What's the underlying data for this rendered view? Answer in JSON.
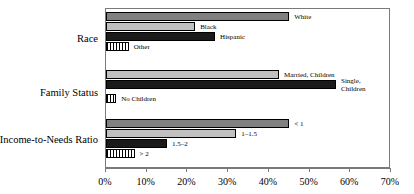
{
  "chart_data": {
    "type": "bar",
    "orientation": "horizontal",
    "title": "",
    "xlabel": "",
    "ylabel": "",
    "xlim": [
      0,
      70
    ],
    "xunit": "%",
    "xticks": [
      "0%",
      "10%",
      "20%",
      "30%",
      "40%",
      "50%",
      "60%",
      "70%"
    ],
    "xtick_values": [
      0,
      10,
      20,
      30,
      40,
      50,
      60,
      70
    ],
    "grid": false,
    "legend": "none",
    "groups": [
      {
        "label": "Race",
        "bars": [
          {
            "label": "White",
            "value": 45.0,
            "style": "dark-gray"
          },
          {
            "label": "Black",
            "value": 21.9,
            "style": "light-gray"
          },
          {
            "label": "Hispanic",
            "value": 26.8,
            "style": "black"
          },
          {
            "label": "Other",
            "value": 5.6,
            "style": "hatch"
          }
        ]
      },
      {
        "label": "Family Status",
        "bars": [
          {
            "label": "Married, Children",
            "value": 42.5,
            "style": "light-gray"
          },
          {
            "label": "Single, Children",
            "value": 56.5,
            "style": "black"
          },
          {
            "label": "No Children",
            "value": 2.5,
            "style": "hatch"
          }
        ]
      },
      {
        "label": "Income-to-Needs Ratio",
        "bars": [
          {
            "label": "< 1",
            "value": 45.0,
            "style": "dark-gray"
          },
          {
            "label": "1–1.5",
            "value": 32.0,
            "style": "light-gray"
          },
          {
            "label": "1.5–2",
            "value": 15.0,
            "style": "black"
          },
          {
            "label": "> 2",
            "value": 7.0,
            "style": "hatch"
          }
        ]
      }
    ],
    "colors": {
      "dark-gray": "#808080",
      "light-gray": "#c0c0c0",
      "black": "#1a1a1a",
      "hatch": "#000000",
      "axis": "#7a7a7a",
      "text": "#000000",
      "background": "#ffffff"
    }
  }
}
